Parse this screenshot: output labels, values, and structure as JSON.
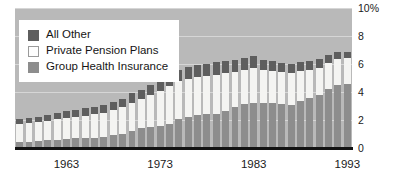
{
  "chart_data": {
    "type": "bar",
    "title": "",
    "subtitle": "",
    "xlabel": "",
    "ylabel": "",
    "stacked": true,
    "grid": true,
    "legend_position": "top-left",
    "ylim": [
      0,
      10
    ],
    "yticks": [
      0,
      2,
      4,
      6,
      8,
      10
    ],
    "ytick_labels": [
      "0",
      "2",
      "4",
      "6",
      "8",
      "10%"
    ],
    "xtick_labels": [
      "1963",
      "1973",
      "1983",
      "1993"
    ],
    "xticks": [
      1963,
      1973,
      1983,
      1993
    ],
    "x_range": [
      1958,
      1993
    ],
    "categories": [
      1958,
      1959,
      1960,
      1961,
      1962,
      1963,
      1964,
      1965,
      1966,
      1967,
      1968,
      1969,
      1970,
      1971,
      1972,
      1973,
      1974,
      1975,
      1976,
      1977,
      1978,
      1979,
      1980,
      1981,
      1982,
      1983,
      1984,
      1985,
      1986,
      1987,
      1988,
      1989,
      1990,
      1991,
      1992,
      1993
    ],
    "series": [
      {
        "name": "Group Health Insurance",
        "color": "#8d8d8d",
        "values": [
          0.42,
          0.45,
          0.5,
          0.55,
          0.6,
          0.65,
          0.7,
          0.72,
          0.75,
          0.78,
          0.9,
          0.98,
          1.25,
          1.4,
          1.5,
          1.55,
          1.75,
          2.1,
          2.25,
          2.35,
          2.4,
          2.45,
          2.65,
          2.95,
          3.15,
          3.25,
          3.25,
          3.2,
          3.15,
          3.05,
          3.35,
          3.55,
          3.8,
          4.2,
          4.5,
          4.6
        ]
      },
      {
        "name": "Private Pension Plans",
        "color": "#f4f4f2",
        "values": [
          1.3,
          1.32,
          1.35,
          1.4,
          1.45,
          1.5,
          1.55,
          1.6,
          1.65,
          1.72,
          1.8,
          1.92,
          2.0,
          2.1,
          2.3,
          2.55,
          2.65,
          2.7,
          2.7,
          2.7,
          2.75,
          2.8,
          2.7,
          2.45,
          2.4,
          2.5,
          2.35,
          2.3,
          2.25,
          2.3,
          2.15,
          2.05,
          1.95,
          1.9,
          1.85,
          1.8
        ]
      },
      {
        "name": "All Other",
        "color": "#5e5e5e",
        "values": [
          0.38,
          0.38,
          0.4,
          0.42,
          0.45,
          0.48,
          0.5,
          0.53,
          0.55,
          0.58,
          0.6,
          0.62,
          0.65,
          0.68,
          0.72,
          0.75,
          0.78,
          0.8,
          0.82,
          0.85,
          0.88,
          0.9,
          0.9,
          0.9,
          0.85,
          0.8,
          0.72,
          0.7,
          0.68,
          0.68,
          0.65,
          0.62,
          0.6,
          0.58,
          0.52,
          0.45
        ]
      }
    ],
    "totals": [
      2.1,
      2.15,
      2.25,
      2.37,
      2.5,
      2.63,
      2.75,
      2.85,
      2.95,
      3.08,
      3.3,
      3.52,
      3.9,
      4.18,
      4.52,
      4.85,
      5.18,
      5.6,
      5.77,
      5.9,
      6.03,
      6.15,
      6.25,
      6.3,
      6.4,
      6.55,
      6.32,
      6.2,
      6.08,
      6.03,
      6.15,
      6.22,
      6.35,
      6.68,
      6.87,
      6.85
    ]
  },
  "legend": {
    "items": [
      {
        "label": "All Other",
        "swatch": "dark-gray"
      },
      {
        "label": "Private Pension Plans",
        "swatch": "white"
      },
      {
        "label": "Group Health Insurance",
        "swatch": "medium-gray"
      }
    ]
  },
  "colors": {
    "all_other": "#5e5e5e",
    "private_pension_plans": "#f4f4f2",
    "group_health_insurance": "#8d8d8d",
    "plot_background": "#b9b9b9",
    "axis": "#121212",
    "page_background": "#ffffff"
  }
}
